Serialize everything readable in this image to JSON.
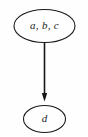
{
  "diagram": {
    "type": "directed-graph",
    "background_color": "#fefefe",
    "stroke_color": "#1a1a1a",
    "nodes": [
      {
        "id": "node-abc",
        "label": "a, b, c",
        "shape": "ellipse",
        "cx": 44.5,
        "cy": 26,
        "rx": 30.5,
        "ry": 16.5,
        "stroke_width": 1.1
      },
      {
        "id": "node-d",
        "label": "d",
        "shape": "ellipse",
        "cx": 44.5,
        "cy": 119,
        "rx": 21,
        "ry": 13.5,
        "stroke_width": 1.1
      }
    ],
    "edges": [
      {
        "id": "edge-abc-to-d",
        "from": "node-abc",
        "to": "node-d",
        "x": 44.5,
        "y_start": 42.5,
        "y_end": 101,
        "stroke_width": 1.6,
        "arrowhead": "filled-triangle"
      }
    ]
  }
}
